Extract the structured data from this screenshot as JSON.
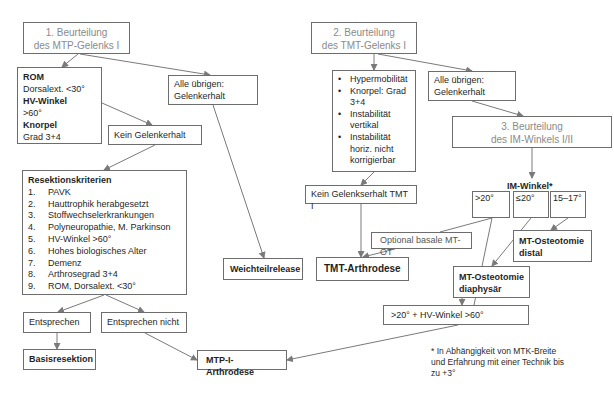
{
  "step1": {
    "line1": "1.  Beurteilung",
    "line2": "des MTP-Gelenks I"
  },
  "rom_box": {
    "h1": "ROM",
    "t1": "Dorsalext. <30°",
    "h2": "HV-Winkel",
    "t2": ">60°",
    "h3": "Knorpel",
    "t3": "Grad 3+4"
  },
  "alle_left": {
    "line1": "Alle übrigen:",
    "line2": "Gelenkerhalt"
  },
  "kein_gelenkerhalt": "Kein Gelenkerhalt",
  "resektion": {
    "title": "Resektionskriterien",
    "items": [
      {
        "n": "1.",
        "t": "PAVK"
      },
      {
        "n": "2.",
        "t": "Hauttrophik herabgesetzt"
      },
      {
        "n": "3.",
        "t": "Stoffwechselerkrankungen"
      },
      {
        "n": "4.",
        "t": "Polyneuropathie, M. Parkinson"
      },
      {
        "n": "5.",
        "t": "HV-Winkel >60°"
      },
      {
        "n": "6.",
        "t": "Hohes biologisches Alter"
      },
      {
        "n": "7.",
        "t": "Demenz"
      },
      {
        "n": "8.",
        "t": "Arthrosegrad 3+4"
      },
      {
        "n": "9.",
        "t": "ROM, Dorsalext. <30°"
      }
    ]
  },
  "entsprechen": "Entsprechen",
  "entsprechen_nicht": "Entsprechen nicht",
  "basisresektion": "Basisresektion",
  "mtp_arthrodese": "MTP-I-Arthrodese",
  "weichteilrelease": "Weichteilrelease",
  "step2": {
    "line1": "2. Beurteilung",
    "line2": "des TMT-Gelenks I"
  },
  "tmt_criteria": {
    "bullet": "•",
    "items": [
      "Hypermobilität",
      "Knorpel: Grad 3+4",
      "Instabilität vertikal",
      "Instabilität horiz. nicht korrigierbar"
    ]
  },
  "alle_right": {
    "line1": "Alle übrigen:",
    "line2": "Gelenkerhalt"
  },
  "step3": {
    "line1": "3. Beurteilung",
    "line2": "des IM-Winkels I/II"
  },
  "kein_tmt": "Kein Gelenkserhalt TMT I",
  "tmt_arthrodese": "TMT-Arthrodese",
  "optional_mtot": "Optional basale  MT-OT",
  "im_winkel_label": "IM-Winkel*",
  "im_ranges": [
    ">20°",
    "≤20°",
    "15–17°"
  ],
  "mt_distal": {
    "line1": "MT-Osteotomie",
    "line2": "distal"
  },
  "mt_diaphysaer": {
    "line1": "MT-Osteotomie",
    "line2": "diaphysär"
  },
  "combo": ">20° + HV-Winkel >60°",
  "footnote": {
    "line1": "* In Abhängigkeit von MTK-Breite",
    "line2": "und Erfahrung mit einer Technik bis",
    "line3": "zu +3°"
  }
}
